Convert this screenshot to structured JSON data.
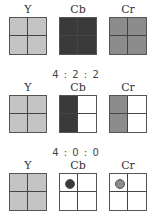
{
  "colors": {
    "y": "#c4c4c4",
    "cb": "#3a3a3a",
    "cr": "#8c8c8c",
    "empty": "#ffffff"
  },
  "sections": [
    {
      "ratio": "",
      "labels": [
        "Y",
        "Cb",
        "Cr"
      ],
      "grids": [
        {
          "component": "Y",
          "cells": [
            "y",
            "y",
            "y",
            "y"
          ]
        },
        {
          "component": "Cb",
          "cells": [
            "cb",
            "cb",
            "cb",
            "cb"
          ]
        },
        {
          "component": "Cr",
          "cells": [
            "cr",
            "cr",
            "cr",
            "cr"
          ]
        }
      ]
    },
    {
      "ratio": "4 : 2 : 2",
      "labels": [
        "Y",
        "Cb",
        "Cr"
      ],
      "grids": [
        {
          "component": "Y",
          "cells": [
            "y",
            "y",
            "y",
            "y"
          ]
        },
        {
          "component": "Cb",
          "cells": [
            "cb",
            "empty",
            "cb",
            "empty"
          ]
        },
        {
          "component": "Cr",
          "cells": [
            "cr",
            "empty",
            "cr",
            "empty"
          ]
        }
      ]
    },
    {
      "ratio": "4 : 0 : 0",
      "labels": [
        "Y",
        "Cb",
        "Cr"
      ],
      "grids": [
        {
          "component": "Y",
          "cells": [
            "y",
            "y",
            "y",
            "y"
          ]
        },
        {
          "component": "Cb",
          "cells": [
            "empty",
            "empty",
            "empty",
            "empty"
          ],
          "dot": "cb"
        },
        {
          "component": "Cr",
          "cells": [
            "empty",
            "empty",
            "empty",
            "empty"
          ],
          "dot": "cr"
        }
      ]
    }
  ]
}
